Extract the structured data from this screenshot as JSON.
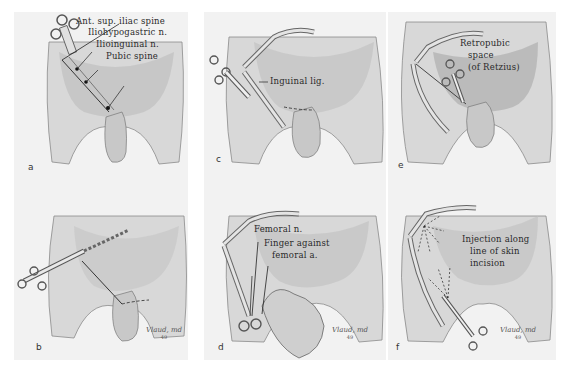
{
  "figure": {
    "colors": {
      "background": "#ffffff",
      "panel": "#f2f2f2",
      "shading": "#9a9a9a",
      "ink": "#2a2a2a"
    },
    "panels": [
      {
        "id": "a",
        "letter": "a",
        "labels": [
          "Ant. sup. iliac spine",
          "Iliohypogastric n.",
          "Ilioinguinal n.",
          "Pubic spine"
        ],
        "markers": [
          "1",
          "2",
          "3"
        ],
        "signature": ""
      },
      {
        "id": "b",
        "letter": "b",
        "labels": [],
        "markers": [
          "3"
        ],
        "signature": {
          "name": "Vlaud, md",
          "year": "49"
        }
      },
      {
        "id": "c",
        "letter": "c",
        "labels": [
          "Inguinal lig."
        ],
        "markers": [
          "1",
          "2"
        ],
        "signature": ""
      },
      {
        "id": "d",
        "letter": "d",
        "labels": [
          "Femoral n.",
          "Finger against",
          "femoral a."
        ],
        "markers": [
          "1"
        ],
        "signature": {
          "name": "Vlaud, md",
          "year": "49"
        }
      },
      {
        "id": "e",
        "letter": "e",
        "labels": [
          "Retropubic",
          "space",
          "(of Retzius)"
        ],
        "markers": [
          "1",
          "2",
          "3"
        ],
        "signature": ""
      },
      {
        "id": "f",
        "letter": "f",
        "labels": [
          "Injection along",
          "line of skin",
          "incision"
        ],
        "markers": [],
        "signature": {
          "name": "Vlaud, md",
          "year": "49"
        }
      }
    ]
  }
}
